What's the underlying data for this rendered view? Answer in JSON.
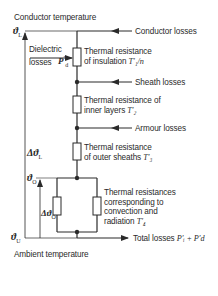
{
  "diagram": {
    "title_top": "Conductor temperature",
    "title_bottom": "Ambient temperature",
    "symbols": {
      "theta_L": "ϑ",
      "theta_L_sub": "L",
      "delta_theta_L": "Δϑ",
      "delta_theta_L_sub": "L",
      "theta_O": "ϑ",
      "theta_O_sub": "O",
      "delta_theta_O": "Δϑ",
      "delta_theta_O_sub": "O",
      "theta_U": "ϑ",
      "theta_U_sub": "U"
    },
    "inputs": [
      {
        "label": "Conductor losses"
      },
      {
        "label": "Sheath losses"
      },
      {
        "label": "Armour losses"
      }
    ],
    "dielectric": {
      "line1": "Dielectric",
      "line2": "losses",
      "symbol": "P",
      "symbol_sub": "d",
      "symbol_sup": "′"
    },
    "resistances": [
      {
        "line1": "Thermal resistance",
        "line2": "of insulation",
        "symbol": "T′₁/n"
      },
      {
        "line1": "Thermal resistance of",
        "line2": "inner layers",
        "symbol": "T′₂"
      },
      {
        "line1": "Thermal resistance",
        "line2": "of outer sheaths",
        "symbol": "T′₃"
      },
      {
        "line1": "Thermal resistances",
        "line2": "corresponding to",
        "line3": "convection and",
        "line4": "radiation",
        "symbol": "T′₄"
      }
    ],
    "output": {
      "label": "Total losses",
      "symbol": "P′ᵢ + P′d"
    }
  }
}
